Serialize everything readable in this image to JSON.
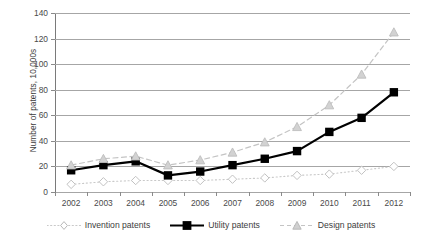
{
  "chart_data": {
    "type": "line",
    "title": "",
    "subtitle": "",
    "xlabel": "",
    "ylabel": "Number of patents, 10,000s",
    "categories": [
      "2002",
      "2003",
      "2004",
      "2005",
      "2006",
      "2007",
      "2008",
      "2009",
      "2010",
      "2011",
      "2012"
    ],
    "ylim": [
      0,
      140
    ],
    "yticks": [
      0,
      20,
      40,
      60,
      80,
      100,
      120,
      140
    ],
    "grid": "horizontal",
    "legend_position": "bottom",
    "series": [
      {
        "name": "Invention patents",
        "marker": "diamond",
        "line_style": "dotted",
        "color": "#c9c9c9",
        "values": [
          6,
          8,
          9,
          9,
          9,
          10,
          11,
          13,
          14,
          17,
          20
        ]
      },
      {
        "name": "Utility patents",
        "marker": "square",
        "line_style": "solid",
        "color": "#000000",
        "values": [
          17,
          21,
          24,
          13,
          16,
          21,
          26,
          32,
          47,
          58,
          78
        ]
      },
      {
        "name": "Design patents",
        "marker": "triangle",
        "line_style": "dashed",
        "color": "#c4c4c4",
        "values": [
          21,
          26,
          28,
          21,
          25,
          31,
          39,
          51,
          68,
          92,
          125
        ]
      }
    ]
  },
  "axes": {
    "y_title": "Number of patents, 10,000s",
    "y_tick_labels": [
      "140",
      "120",
      "100",
      "80",
      "60",
      "40",
      "20",
      "0"
    ],
    "x_tick_labels": [
      "2002",
      "2003",
      "2004",
      "2005",
      "2006",
      "2007",
      "2008",
      "2009",
      "2010",
      "2011",
      "2012"
    ]
  },
  "legend": {
    "items": [
      {
        "label": "Invention patents"
      },
      {
        "label": "Utility patents"
      },
      {
        "label": "Design patents"
      }
    ]
  }
}
